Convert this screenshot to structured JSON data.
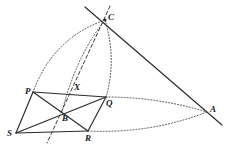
{
  "figure": {
    "width": 226,
    "height": 150,
    "background": "#ffffff",
    "stroke_color": "#2a2a2a",
    "dash_color": "#3a3a3a",
    "dot_color": "#4a4a4a",
    "label_color": "#1b1b1b"
  },
  "points": [
    {
      "id": "C",
      "label": "C",
      "x": 105,
      "y": 20,
      "label_x": 108,
      "label_y": 13,
      "dot": true
    },
    {
      "id": "P",
      "label": "P",
      "x": 33,
      "y": 92,
      "label_x": 25,
      "label_y": 87,
      "dot": false
    },
    {
      "id": "X",
      "label": "X",
      "x": 76,
      "y": 91,
      "label_x": 74,
      "label_y": 83,
      "dot": false
    },
    {
      "id": "Q",
      "label": "Q",
      "x": 106,
      "y": 97,
      "label_x": 106,
      "label_y": 99,
      "dot": false
    },
    {
      "id": "B",
      "label": "B",
      "x": 62,
      "y": 112,
      "label_x": 62,
      "label_y": 114,
      "dot": false
    },
    {
      "id": "S",
      "label": "S",
      "x": 16,
      "y": 133,
      "label_x": 7,
      "label_y": 129,
      "dot": false
    },
    {
      "id": "R",
      "label": "R",
      "x": 88,
      "y": 131,
      "label_x": 85,
      "label_y": 134,
      "dot": false
    },
    {
      "id": "A",
      "label": "A",
      "x": 207,
      "y": 112,
      "label_x": 210,
      "label_y": 105,
      "dot": false
    }
  ],
  "solid_segments": [
    {
      "name": "side-PQ",
      "from": "P",
      "to": "Q",
      "x1": 33,
      "y1": 92,
      "x2": 106,
      "y2": 97
    },
    {
      "name": "side-QR",
      "from": "Q",
      "to": "R",
      "x1": 106,
      "y1": 97,
      "x2": 88,
      "y2": 131
    },
    {
      "name": "side-RS",
      "from": "R",
      "to": "S",
      "x1": 88,
      "y1": 131,
      "x2": 16,
      "y2": 133
    },
    {
      "name": "side-SP",
      "from": "S",
      "to": "P",
      "x1": 16,
      "y1": 133,
      "x2": 33,
      "y2": 92
    },
    {
      "name": "diagonal-PR",
      "from": "P",
      "to": "R",
      "x1": 33,
      "y1": 92,
      "x2": 88,
      "y2": 131
    },
    {
      "name": "diagonal-SQ",
      "from": "S",
      "to": "Q",
      "x1": 16,
      "y1": 133,
      "x2": 106,
      "y2": 97
    },
    {
      "name": "line-through-C-and-A",
      "from": "C",
      "to": "A",
      "x1": 85,
      "y1": 7,
      "x2": 222,
      "y2": 125
    }
  ],
  "dashed_segments": [
    {
      "name": "dashed-line-C-X-B",
      "x1": 110,
      "y1": 6,
      "x2": 47,
      "y2": 143
    }
  ],
  "dotted_arcs": [
    {
      "name": "arc-C-to-P",
      "x1": 105,
      "y1": 20,
      "cx": 53,
      "cy": 38,
      "x2": 33,
      "y2": 92
    },
    {
      "name": "arc-C-to-B",
      "x1": 105,
      "y1": 20,
      "cx": 76,
      "cy": 56,
      "x2": 62,
      "y2": 112
    },
    {
      "name": "arc-C-to-Q",
      "x1": 105,
      "y1": 20,
      "cx": 117,
      "cy": 60,
      "x2": 106,
      "y2": 97
    },
    {
      "name": "arc-Q-to-A",
      "x1": 106,
      "y1": 97,
      "cx": 158,
      "cy": 97,
      "x2": 207,
      "y2": 112
    },
    {
      "name": "arc-R-to-A",
      "x1": 88,
      "y1": 131,
      "cx": 150,
      "cy": 134,
      "x2": 207,
      "y2": 112
    }
  ]
}
